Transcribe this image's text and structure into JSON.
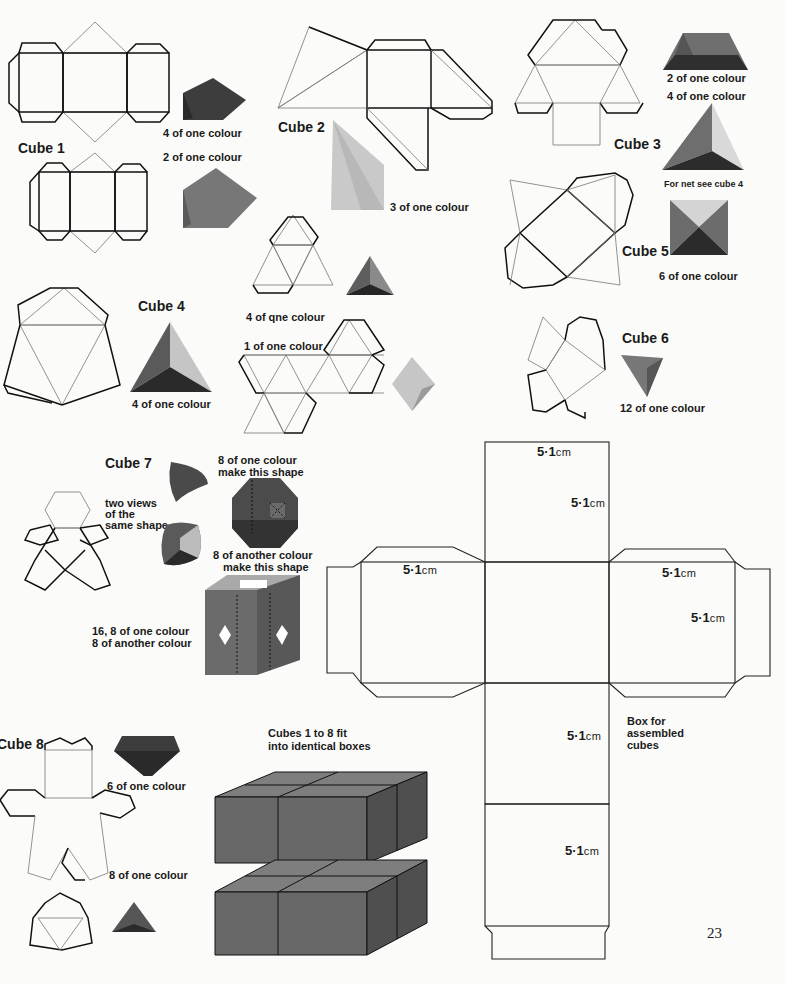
{
  "page": {
    "number": "23"
  },
  "cubes": [
    {
      "id": "cube1",
      "title": "Cube 1",
      "notes": [
        "4 of one colour",
        "2 of one colour"
      ]
    },
    {
      "id": "cube2",
      "title": "Cube 2",
      "notes": [
        "3 of one colour"
      ]
    },
    {
      "id": "cube3",
      "title": "Cube 3",
      "notes": [
        "2 of one colour",
        "4 of one colour",
        "For net see cube 4"
      ]
    },
    {
      "id": "cube4",
      "title": "Cube 4",
      "notes": [
        "4 of one colour",
        "4 of qne colour",
        "1 of one colour"
      ]
    },
    {
      "id": "cube5",
      "title": "Cube 5",
      "notes": [
        "6 of one colour"
      ]
    },
    {
      "id": "cube6",
      "title": "Cube 6",
      "notes": [
        "12 of one colour"
      ]
    },
    {
      "id": "cube7",
      "title": "Cube 7",
      "notes": [
        "8 of one colour",
        "make this shape",
        "two views",
        "of the",
        "same shape",
        "8 of another colour",
        "make this shape",
        "16, 8 of one colour",
        "8 of another colour"
      ]
    },
    {
      "id": "cube8",
      "title": "Cube 8",
      "notes": [
        "6 of one colour",
        "8 of one colour"
      ]
    }
  ],
  "boxes": {
    "caption_line1": "Cubes 1 to 8 fit",
    "caption_line2": "into identical boxes"
  },
  "box_net": {
    "caption": [
      "Box for",
      "assembled",
      "cubes"
    ],
    "dimension_value": "5·1",
    "dimension_unit": "cm"
  },
  "colors": {
    "dark_solid": "#3e3e3e",
    "mid_solid": "#6a6a6a",
    "light_solid": "#b9b9b9",
    "page_bg": "#fbfbf9"
  }
}
